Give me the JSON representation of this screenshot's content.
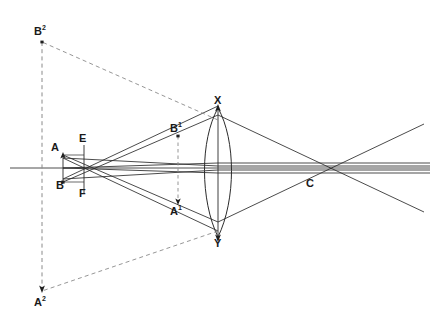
{
  "figure": {
    "type": "optical-ray-diagram",
    "width": 436,
    "height": 328,
    "background_color": "#ffffff",
    "stroke_color": "#2b2b2b",
    "dashed_color": "#8a8a8a",
    "axis_color": "#3a3a3a"
  },
  "labels": [
    {
      "id": "B2",
      "text": "B",
      "superscript": "2",
      "x": 34,
      "y": 26,
      "name": "label-b-squared"
    },
    {
      "id": "X",
      "text": "X",
      "superscript": "",
      "x": 214,
      "y": 95,
      "name": "label-x"
    },
    {
      "id": "E",
      "text": "E",
      "superscript": "",
      "x": 79,
      "y": 133,
      "name": "label-e"
    },
    {
      "id": "B1",
      "text": "B",
      "superscript": "1",
      "x": 170,
      "y": 123,
      "name": "label-b-prime"
    },
    {
      "id": "A",
      "text": "A",
      "superscript": "",
      "x": 51,
      "y": 142,
      "name": "label-a"
    },
    {
      "id": "B",
      "text": "B",
      "superscript": "",
      "x": 56,
      "y": 180,
      "name": "label-b"
    },
    {
      "id": "F",
      "text": "F",
      "superscript": "",
      "x": 79,
      "y": 188,
      "name": "label-f"
    },
    {
      "id": "A1",
      "text": "A",
      "superscript": "1",
      "x": 170,
      "y": 206,
      "name": "label-a-prime"
    },
    {
      "id": "C",
      "text": "C",
      "superscript": "",
      "x": 306,
      "y": 178,
      "name": "label-c"
    },
    {
      "id": "Y",
      "text": "Y",
      "superscript": "",
      "x": 214,
      "y": 238,
      "name": "label-y"
    },
    {
      "id": "A2",
      "text": "A",
      "superscript": "2",
      "x": 34,
      "y": 297,
      "name": "label-a-squared"
    }
  ],
  "points": {
    "A": {
      "x": 63,
      "y": 155
    },
    "B": {
      "x": 63,
      "y": 182
    },
    "E": {
      "x": 84,
      "y": 148
    },
    "F": {
      "x": 84,
      "y": 190
    },
    "Bp": {
      "x": 178,
      "y": 136
    },
    "Ap": {
      "x": 178,
      "y": 203
    },
    "X": {
      "x": 218,
      "y": 108
    },
    "Y": {
      "x": 218,
      "y": 237
    },
    "C": {
      "x": 311,
      "y": 168
    },
    "B2": {
      "x": 42,
      "y": 42
    },
    "A2": {
      "x": 42,
      "y": 291
    }
  },
  "axis": {
    "y": 168,
    "x_start": 10,
    "x_end": 430
  },
  "legend_note": ""
}
